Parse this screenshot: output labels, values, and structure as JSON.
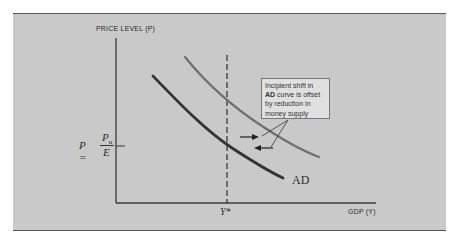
{
  "diagram": {
    "y_axis_label": "PRICE LEVEL (P)",
    "x_axis_label": "GDP (Y)",
    "x_marker_label": "Y*",
    "price_equation": {
      "lhs": "P =",
      "numerator": "P",
      "numerator_subscript": "u",
      "denominator": "E"
    },
    "curve_label": "AD",
    "callout": {
      "line1": "Incipient shift in",
      "line2_bold": "AD",
      "line2_rest": " curve is offset",
      "line3": "by reduction in",
      "line4": "money supply"
    },
    "curves": [
      {
        "name": "AD (original)",
        "color": "#3a3a3a",
        "points": [
          [
            153,
            76
          ],
          [
            190,
            114
          ],
          [
            227,
            146
          ],
          [
            283,
            178
          ]
        ]
      },
      {
        "name": "AD (incipient shift)",
        "color": "#6a6a6a",
        "points": [
          [
            185,
            57
          ],
          [
            206,
            82
          ],
          [
            227,
            100
          ],
          [
            285,
            143
          ],
          [
            319,
            157
          ]
        ]
      }
    ],
    "arrows": [
      {
        "direction": "right",
        "from": [
          240,
          137
        ],
        "to": [
          259,
          137
        ]
      },
      {
        "direction": "left",
        "from": [
          273,
          148
        ],
        "to": [
          254,
          148
        ]
      }
    ],
    "colors": {
      "background": "#c9c9c9",
      "axis": "#3a3a3a",
      "ad_curve": "#3a3a3a",
      "shifted_curve": "#707070",
      "callout_bg": "#e0e0e0"
    }
  }
}
